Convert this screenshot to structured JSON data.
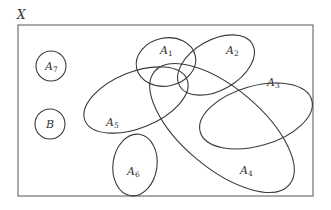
{
  "diagram": {
    "type": "venn-diagram",
    "universe": {
      "label": "X"
    },
    "sets": [
      {
        "id": "A1",
        "base": "A",
        "sub": "1"
      },
      {
        "id": "A2",
        "base": "A",
        "sub": "2"
      },
      {
        "id": "A3",
        "base": "A",
        "sub": "3"
      },
      {
        "id": "A4",
        "base": "A",
        "sub": "4"
      },
      {
        "id": "A5",
        "base": "A",
        "sub": "5"
      },
      {
        "id": "A6",
        "base": "A",
        "sub": "6"
      },
      {
        "id": "A7",
        "base": "A",
        "sub": "7"
      },
      {
        "id": "B",
        "base": "B",
        "sub": ""
      }
    ],
    "colors": {
      "stroke": "#3a3a3a",
      "frame": "#555555",
      "background": "#ffffff"
    }
  }
}
